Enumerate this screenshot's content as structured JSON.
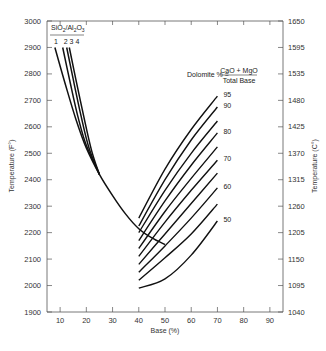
{
  "chart_data": {
    "type": "line",
    "title": "",
    "xlabel": "Base (%)",
    "ylabel": "Temperature (F°)",
    "ylabel_right": "Temperature (C°)",
    "xlim": [
      5,
      95
    ],
    "ylim": [
      1900,
      3000
    ],
    "x_ticks": [
      10,
      20,
      30,
      40,
      50,
      60,
      70,
      80,
      90
    ],
    "y_ticks": [
      1900,
      2000,
      2100,
      2200,
      2300,
      2400,
      2500,
      2600,
      2700,
      2800,
      2900,
      3000
    ],
    "y_ticks_right": [
      1040,
      1095,
      1150,
      1205,
      1260,
      1315,
      1370,
      1425,
      1480,
      1535,
      1595,
      1650
    ],
    "grid": false,
    "legend": "inline annotations",
    "annotations": {
      "sio2_al2o3_title": "SiO2/Al2O3",
      "sio2_al2o3_labels": [
        "1",
        "2",
        "3",
        "4"
      ],
      "dolomite_formula_left": "Dolomite % =",
      "dolomite_formula_numerator": "CaO + MgO",
      "dolomite_formula_denominator": "Total Base"
    },
    "silica_alumina_series": [
      {
        "name": "SiO2/Al2O3 = 1",
        "x": [
          8,
          12,
          16,
          20,
          25,
          30,
          35,
          40,
          45,
          50
        ],
        "values": [
          2900,
          2760,
          2630,
          2520,
          2420,
          2340,
          2270,
          2215,
          2180,
          2155
        ]
      },
      {
        "name": "SiO2/Al2O3 = 2",
        "x": [
          11,
          14,
          17,
          20,
          25
        ],
        "values": [
          2900,
          2760,
          2630,
          2530,
          2420
        ]
      },
      {
        "name": "SiO2/Al2O3 = 3",
        "x": [
          12.5,
          15,
          18,
          21,
          25
        ],
        "values": [
          2900,
          2780,
          2640,
          2520,
          2420
        ]
      },
      {
        "name": "SiO2/Al2O3 = 4",
        "x": [
          13.5,
          16,
          19,
          22,
          25
        ],
        "values": [
          2900,
          2780,
          2640,
          2510,
          2420
        ]
      }
    ],
    "dolomite_series": [
      {
        "name": "95",
        "x": [
          40,
          50,
          60,
          70
        ],
        "values": [
          2255,
          2440,
          2590,
          2716
        ],
        "label_visible": true
      },
      {
        "name": "90",
        "x": [
          40,
          50,
          60,
          70
        ],
        "values": [
          2225,
          2400,
          2550,
          2675
        ],
        "label_visible": true
      },
      {
        "name": "85",
        "x": [
          40,
          50,
          60,
          70
        ],
        "values": [
          2200,
          2360,
          2500,
          2622
        ],
        "label_visible": false
      },
      {
        "name": "80",
        "x": [
          40,
          50,
          60,
          70
        ],
        "values": [
          2170,
          2320,
          2455,
          2577
        ],
        "label_visible": true
      },
      {
        "name": "75",
        "x": [
          40,
          50,
          60,
          70
        ],
        "values": [
          2140,
          2280,
          2405,
          2524
        ],
        "label_visible": false
      },
      {
        "name": "70",
        "x": [
          40,
          50,
          60,
          70
        ],
        "values": [
          2110,
          2240,
          2360,
          2474
        ],
        "label_visible": true
      },
      {
        "name": "65",
        "x": [
          40,
          50,
          60,
          70
        ],
        "values": [
          2080,
          2195,
          2310,
          2425
        ],
        "label_visible": false
      },
      {
        "name": "60",
        "x": [
          40,
          50,
          60,
          70
        ],
        "values": [
          2050,
          2150,
          2255,
          2369
        ],
        "label_visible": true
      },
      {
        "name": "55",
        "x": [
          40,
          50,
          60,
          70
        ],
        "values": [
          2020,
          2105,
          2195,
          2308
        ],
        "label_visible": false
      },
      {
        "name": "50",
        "x": [
          40,
          50,
          60,
          70
        ],
        "values": [
          1990,
          2025,
          2115,
          2244
        ],
        "label_visible": true
      }
    ]
  },
  "labels": {
    "xlabel": "Base (%)",
    "ylabel": "Temperature (F°)",
    "ylabel_right": "Temperature (C°)",
    "sio2": "SiO",
    "sio2_sub": "2",
    "al2o3_a": "/Al",
    "al2o3_sub1": "2",
    "al2o3_b": "O",
    "al2o3_sub2": "3",
    "ratio_nums": "1   2 3 4",
    "dolomite_left": "Dolomite % =",
    "dolomite_num": "CaO + MgO",
    "dolomite_den": "Total Base"
  }
}
